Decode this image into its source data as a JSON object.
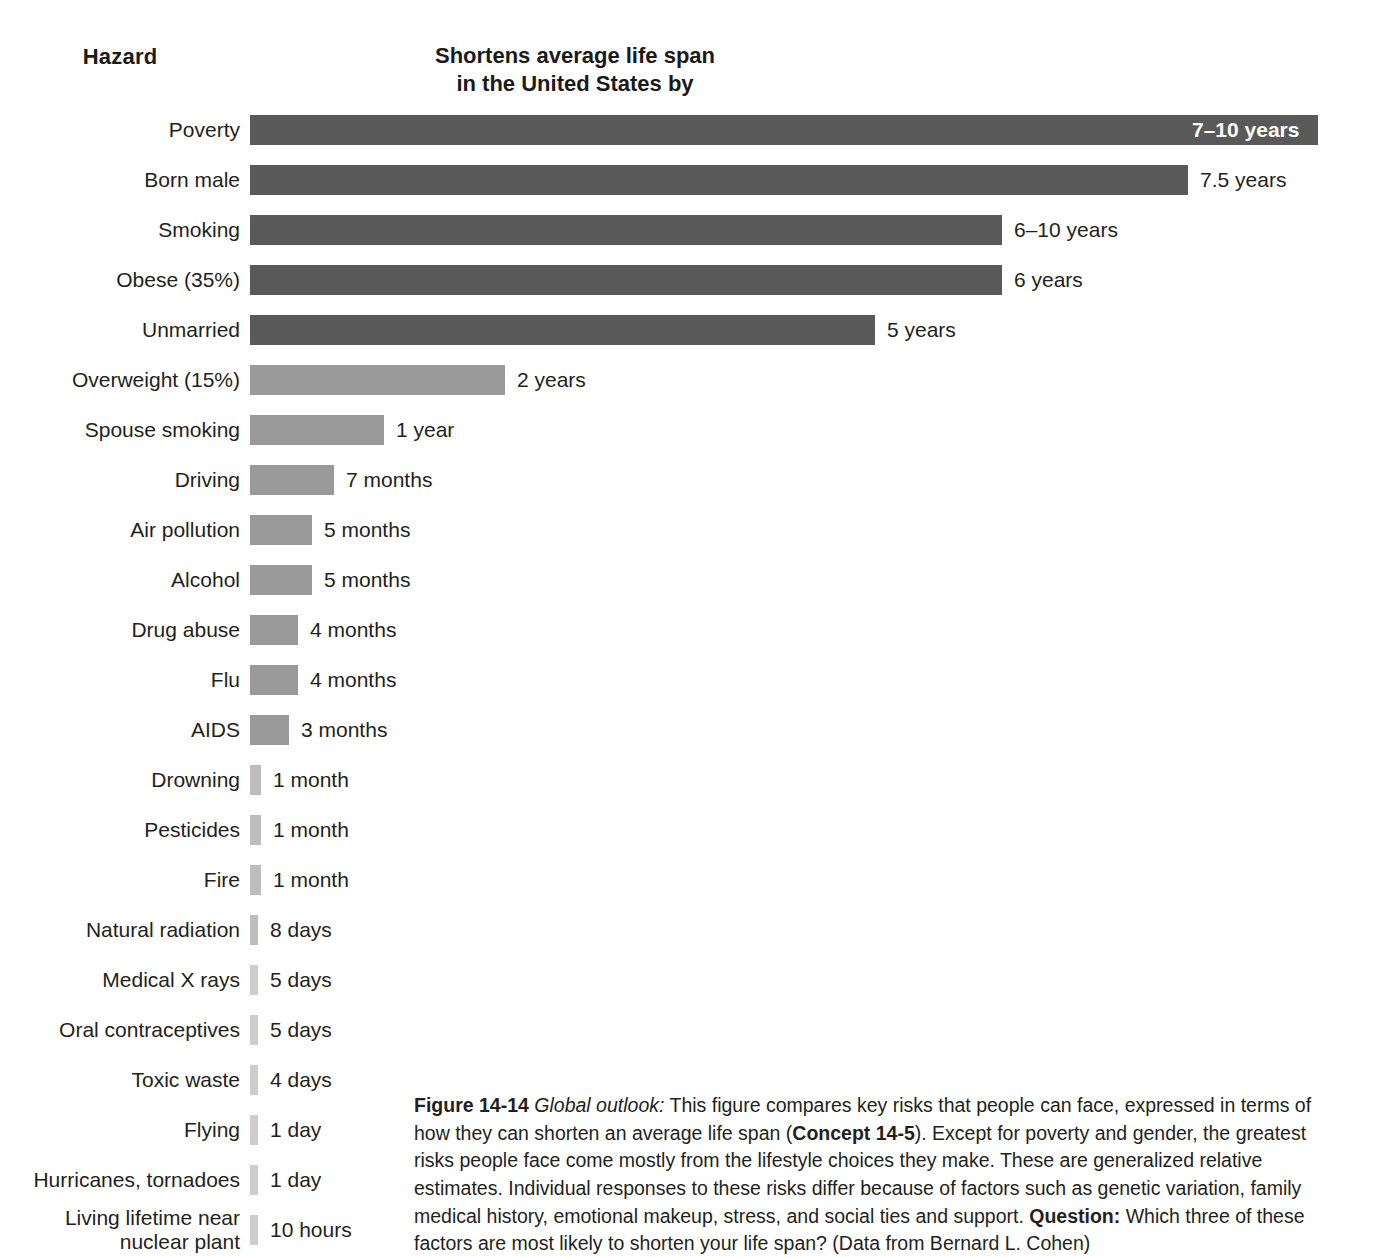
{
  "header": {
    "hazard_label": "Hazard",
    "measure_line1": "Shortens average life span",
    "measure_line2": "in the United States by"
  },
  "colors": {
    "bar_dark": "#595959",
    "bar_mid": "#9a9a9a",
    "bar_light": "#bdbdbd",
    "bar_lightest": "#cdcdcd",
    "text": "#231f20",
    "inside_label": "#ffffff",
    "background": "#ffffff"
  },
  "caption": {
    "figure_number": "Figure 14-14",
    "lead_in": "Global outlook:",
    "text_part1": " This figure compares key risks that people can face, expressed in terms of how they can shorten an average life span (",
    "concept_ref": "Concept 14-5",
    "text_part2": "). Except for poverty and gender, the greatest risks people face come mostly from the lifestyle choices they make. These are generalized relative estimates. Individual responses to these risks differ because of factors such as genetic variation, family medical history, emotional makeup, stress, and social ties and support. ",
    "question_label": "Question:",
    "question_text": " Which three of these factors are most likely to shorten your life span? (Data from Bernard L. Cohen)"
  },
  "chart_data": {
    "type": "bar",
    "orientation": "horizontal",
    "title": "Shortens average life span in the United States by",
    "xlabel": "Shortens average life span in the United States by",
    "ylabel": "Hazard",
    "grid": false,
    "legend": null,
    "source": "Data from Bernard L. Cohen",
    "categories": [
      "Poverty",
      "Born male",
      "Smoking",
      "Obese (35%)",
      "Unmarried",
      "Overweight (15%)",
      "Spouse smoking",
      "Driving",
      "Air pollution",
      "Alcohol",
      "Drug abuse",
      "Flu",
      "AIDS",
      "Drowning",
      "Pesticides",
      "Fire",
      "Natural radiation",
      "Medical X rays",
      "Oral contraceptives",
      "Toxic waste",
      "Flying",
      "Hurricanes, tornadoes",
      "Living lifetime near nuclear plant"
    ],
    "value_labels": [
      "7–10 years",
      "7.5 years",
      "6–10 years",
      "6 years",
      "5 years",
      "2 years",
      "1 year",
      "7 months",
      "5 months",
      "5 months",
      "4 months",
      "4 months",
      "3 months",
      "1 month",
      "1 month",
      "1 month",
      "8 days",
      "5 days",
      "5 days",
      "4 days",
      "1 day",
      "1 day",
      "10 hours"
    ],
    "values_years": [
      8.5,
      7.5,
      8,
      6,
      5,
      2,
      1,
      0.583,
      0.417,
      0.417,
      0.333,
      0.333,
      0.25,
      0.083,
      0.083,
      0.083,
      0.022,
      0.014,
      0.014,
      0.011,
      0.0027,
      0.0027,
      0.0011
    ],
    "rows": [
      {
        "label": "Poverty",
        "label_line2": "",
        "value": "7–10 years",
        "bar_px": 1068,
        "shade": "dark",
        "label_inside": true
      },
      {
        "label": "Born male",
        "label_line2": "",
        "value": "7.5 years",
        "bar_px": 938,
        "shade": "dark",
        "label_inside": false
      },
      {
        "label": "Smoking",
        "label_line2": "",
        "value": "6–10 years",
        "bar_px": 752,
        "shade": "dark",
        "label_inside": false
      },
      {
        "label": "Obese (35%)",
        "label_line2": "",
        "value": "6 years",
        "bar_px": 752,
        "shade": "dark",
        "label_inside": false
      },
      {
        "label": "Unmarried",
        "label_line2": "",
        "value": "5 years",
        "bar_px": 625,
        "shade": "dark",
        "label_inside": false
      },
      {
        "label": "Overweight (15%)",
        "label_line2": "",
        "value": "2 years",
        "bar_px": 255,
        "shade": "mid",
        "label_inside": false
      },
      {
        "label": "Spouse smoking",
        "label_line2": "",
        "value": "1 year",
        "bar_px": 134,
        "shade": "mid",
        "label_inside": false
      },
      {
        "label": "Driving",
        "label_line2": "",
        "value": "7 months",
        "bar_px": 84,
        "shade": "mid",
        "label_inside": false
      },
      {
        "label": "Air pollution",
        "label_line2": "",
        "value": "5 months",
        "bar_px": 62,
        "shade": "mid",
        "label_inside": false
      },
      {
        "label": "Alcohol",
        "label_line2": "",
        "value": "5 months",
        "bar_px": 62,
        "shade": "mid",
        "label_inside": false
      },
      {
        "label": "Drug abuse",
        "label_line2": "",
        "value": "4 months",
        "bar_px": 48,
        "shade": "mid",
        "label_inside": false
      },
      {
        "label": "Flu",
        "label_line2": "",
        "value": "4 months",
        "bar_px": 48,
        "shade": "mid",
        "label_inside": false
      },
      {
        "label": "AIDS",
        "label_line2": "",
        "value": "3 months",
        "bar_px": 39,
        "shade": "mid",
        "label_inside": false
      },
      {
        "label": "Drowning",
        "label_line2": "",
        "value": "1 month",
        "bar_px": 11,
        "shade": "light",
        "label_inside": false
      },
      {
        "label": "Pesticides",
        "label_line2": "",
        "value": "1 month",
        "bar_px": 11,
        "shade": "light",
        "label_inside": false
      },
      {
        "label": "Fire",
        "label_line2": "",
        "value": "1 month",
        "bar_px": 11,
        "shade": "light",
        "label_inside": false
      },
      {
        "label": "Natural radiation",
        "label_line2": "",
        "value": "8 days",
        "bar_px": 8,
        "shade": "light",
        "label_inside": false
      },
      {
        "label": "Medical X rays",
        "label_line2": "",
        "value": "5 days",
        "bar_px": 8,
        "shade": "lightest",
        "label_inside": false
      },
      {
        "label": "Oral contraceptives",
        "label_line2": "",
        "value": "5 days",
        "bar_px": 8,
        "shade": "lightest",
        "label_inside": false
      },
      {
        "label": "Toxic waste",
        "label_line2": "",
        "value": "4 days",
        "bar_px": 8,
        "shade": "lightest",
        "label_inside": false
      },
      {
        "label": "Flying",
        "label_line2": "",
        "value": "1 day",
        "bar_px": 8,
        "shade": "lightest",
        "label_inside": false
      },
      {
        "label": "Hurricanes, tornadoes",
        "label_line2": "",
        "value": "1 day",
        "bar_px": 8,
        "shade": "lightest",
        "label_inside": false
      },
      {
        "label": "Living lifetime near",
        "label_line2": "nuclear plant",
        "value": "10 hours",
        "bar_px": 8,
        "shade": "lightest",
        "label_inside": false
      }
    ]
  }
}
